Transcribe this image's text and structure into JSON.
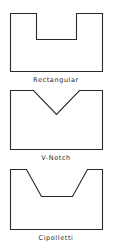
{
  "diagram": {
    "stroke_color": "#2a2a2a",
    "background": "#ffffff",
    "weirs": [
      {
        "id": "rectangular",
        "label": "Rectangular",
        "shape": "rectangular-notch"
      },
      {
        "id": "v-notch",
        "label": "V-Notch",
        "shape": "triangular-notch"
      },
      {
        "id": "cipolletti",
        "label": "Cipolletti",
        "shape": "trapezoidal-notch"
      }
    ]
  }
}
